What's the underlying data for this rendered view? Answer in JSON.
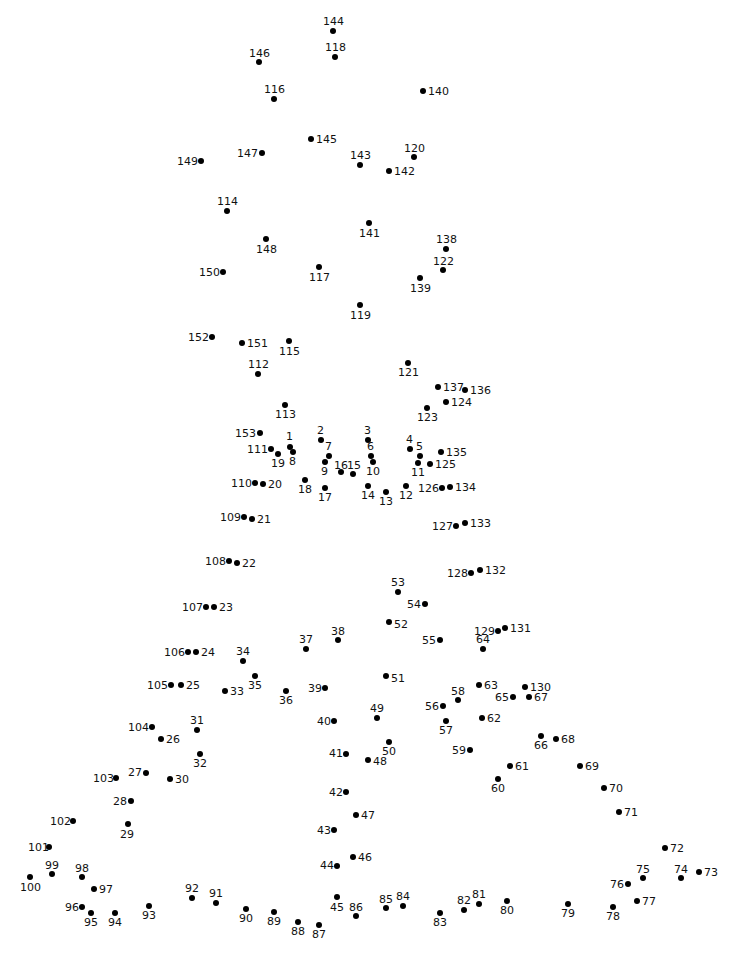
{
  "dot_color": "#000000",
  "label_color": "#111111",
  "background": "#ffffff",
  "dots": [
    {
      "n": "1",
      "x": 290,
      "y": 447,
      "lx": 286,
      "ly": 431
    },
    {
      "n": "2",
      "x": 321,
      "y": 440,
      "lx": 317,
      "ly": 425
    },
    {
      "n": "3",
      "x": 368,
      "y": 440,
      "lx": 364,
      "ly": 425
    },
    {
      "n": "4",
      "x": 410,
      "y": 449,
      "lx": 406,
      "ly": 434
    },
    {
      "n": "5",
      "x": 420,
      "y": 456,
      "lx": 416,
      "ly": 441
    },
    {
      "n": "6",
      "x": 371,
      "y": 456,
      "lx": 367,
      "ly": 441
    },
    {
      "n": "7",
      "x": 329,
      "y": 456,
      "lx": 325,
      "ly": 441
    },
    {
      "n": "8",
      "x": 293,
      "y": 452,
      "lx": 289,
      "ly": 456
    },
    {
      "n": "9",
      "x": 325,
      "y": 462,
      "lx": 321,
      "ly": 466
    },
    {
      "n": "10",
      "x": 373,
      "y": 462,
      "lx": 366,
      "ly": 466
    },
    {
      "n": "11",
      "x": 418,
      "y": 463,
      "lx": 411,
      "ly": 467
    },
    {
      "n": "12",
      "x": 406,
      "y": 486,
      "lx": 399,
      "ly": 490
    },
    {
      "n": "13",
      "x": 386,
      "y": 492,
      "lx": 379,
      "ly": 496
    },
    {
      "n": "14",
      "x": 368,
      "y": 486,
      "lx": 361,
      "ly": 490
    },
    {
      "n": "15",
      "x": 353,
      "y": 474,
      "lx": 347,
      "ly": 460
    },
    {
      "n": "16",
      "x": 341,
      "y": 472,
      "lx": 334,
      "ly": 460
    },
    {
      "n": "17",
      "x": 325,
      "y": 488,
      "lx": 318,
      "ly": 492
    },
    {
      "n": "18",
      "x": 305,
      "y": 480,
      "lx": 298,
      "ly": 484
    },
    {
      "n": "19",
      "x": 278,
      "y": 454,
      "lx": 271,
      "ly": 458
    },
    {
      "n": "20",
      "x": 263,
      "y": 484,
      "lx": 268,
      "ly": 479
    },
    {
      "n": "21",
      "x": 252,
      "y": 519,
      "lx": 257,
      "ly": 514
    },
    {
      "n": "22",
      "x": 237,
      "y": 563,
      "lx": 242,
      "ly": 558
    },
    {
      "n": "23",
      "x": 214,
      "y": 607,
      "lx": 219,
      "ly": 602
    },
    {
      "n": "24",
      "x": 196,
      "y": 652,
      "lx": 201,
      "ly": 647
    },
    {
      "n": "25",
      "x": 181,
      "y": 685,
      "lx": 186,
      "ly": 680
    },
    {
      "n": "26",
      "x": 161,
      "y": 739,
      "lx": 166,
      "ly": 734
    },
    {
      "n": "27",
      "x": 146,
      "y": 773,
      "lx": 128,
      "ly": 767
    },
    {
      "n": "28",
      "x": 131,
      "y": 801,
      "lx": 113,
      "ly": 796
    },
    {
      "n": "29",
      "x": 128,
      "y": 824,
      "lx": 120,
      "ly": 829
    },
    {
      "n": "30",
      "x": 170,
      "y": 779,
      "lx": 175,
      "ly": 774
    },
    {
      "n": "31",
      "x": 197,
      "y": 730,
      "lx": 190,
      "ly": 715
    },
    {
      "n": "32",
      "x": 200,
      "y": 754,
      "lx": 193,
      "ly": 758
    },
    {
      "n": "33",
      "x": 225,
      "y": 691,
      "lx": 230,
      "ly": 686
    },
    {
      "n": "34",
      "x": 243,
      "y": 661,
      "lx": 236,
      "ly": 646
    },
    {
      "n": "35",
      "x": 255,
      "y": 676,
      "lx": 248,
      "ly": 680
    },
    {
      "n": "36",
      "x": 286,
      "y": 691,
      "lx": 279,
      "ly": 695
    },
    {
      "n": "37",
      "x": 306,
      "y": 649,
      "lx": 299,
      "ly": 634
    },
    {
      "n": "38",
      "x": 338,
      "y": 640,
      "lx": 331,
      "ly": 626
    },
    {
      "n": "39",
      "x": 325,
      "y": 688,
      "lx": 308,
      "ly": 683
    },
    {
      "n": "40",
      "x": 334,
      "y": 721,
      "lx": 317,
      "ly": 716
    },
    {
      "n": "41",
      "x": 346,
      "y": 754,
      "lx": 329,
      "ly": 748
    },
    {
      "n": "42",
      "x": 346,
      "y": 792,
      "lx": 329,
      "ly": 787
    },
    {
      "n": "43",
      "x": 334,
      "y": 830,
      "lx": 317,
      "ly": 825
    },
    {
      "n": "44",
      "x": 337,
      "y": 866,
      "lx": 320,
      "ly": 860
    },
    {
      "n": "45",
      "x": 337,
      "y": 897,
      "lx": 330,
      "ly": 902
    },
    {
      "n": "46",
      "x": 353,
      "y": 857,
      "lx": 358,
      "ly": 852
    },
    {
      "n": "47",
      "x": 356,
      "y": 815,
      "lx": 361,
      "ly": 810
    },
    {
      "n": "48",
      "x": 368,
      "y": 760,
      "lx": 373,
      "ly": 756
    },
    {
      "n": "49",
      "x": 377,
      "y": 718,
      "lx": 370,
      "ly": 703
    },
    {
      "n": "50",
      "x": 389,
      "y": 742,
      "lx": 382,
      "ly": 746
    },
    {
      "n": "51",
      "x": 386,
      "y": 676,
      "lx": 391,
      "ly": 673
    },
    {
      "n": "52",
      "x": 389,
      "y": 622,
      "lx": 394,
      "ly": 619
    },
    {
      "n": "53",
      "x": 398,
      "y": 592,
      "lx": 391,
      "ly": 577
    },
    {
      "n": "54",
      "x": 425,
      "y": 604,
      "lx": 407,
      "ly": 599
    },
    {
      "n": "55",
      "x": 440,
      "y": 640,
      "lx": 422,
      "ly": 635
    },
    {
      "n": "56",
      "x": 443,
      "y": 706,
      "lx": 425,
      "ly": 701
    },
    {
      "n": "57",
      "x": 446,
      "y": 721,
      "lx": 439,
      "ly": 725
    },
    {
      "n": "58",
      "x": 458,
      "y": 700,
      "lx": 451,
      "ly": 686
    },
    {
      "n": "59",
      "x": 470,
      "y": 750,
      "lx": 452,
      "ly": 745
    },
    {
      "n": "60",
      "x": 498,
      "y": 779,
      "lx": 491,
      "ly": 783
    },
    {
      "n": "61",
      "x": 510,
      "y": 766,
      "lx": 515,
      "ly": 761
    },
    {
      "n": "62",
      "x": 482,
      "y": 718,
      "lx": 487,
      "ly": 713
    },
    {
      "n": "63",
      "x": 479,
      "y": 685,
      "lx": 484,
      "ly": 680
    },
    {
      "n": "64",
      "x": 483,
      "y": 649,
      "lx": 476,
      "ly": 634
    },
    {
      "n": "65",
      "x": 513,
      "y": 697,
      "lx": 495,
      "ly": 692
    },
    {
      "n": "66",
      "x": 541,
      "y": 736,
      "lx": 534,
      "ly": 740
    },
    {
      "n": "67",
      "x": 529,
      "y": 697,
      "lx": 534,
      "ly": 692
    },
    {
      "n": "68",
      "x": 556,
      "y": 739,
      "lx": 561,
      "ly": 734
    },
    {
      "n": "69",
      "x": 580,
      "y": 766,
      "lx": 585,
      "ly": 761
    },
    {
      "n": "70",
      "x": 604,
      "y": 788,
      "lx": 609,
      "ly": 783
    },
    {
      "n": "71",
      "x": 619,
      "y": 812,
      "lx": 624,
      "ly": 807
    },
    {
      "n": "72",
      "x": 665,
      "y": 848,
      "lx": 670,
      "ly": 843
    },
    {
      "n": "73",
      "x": 699,
      "y": 872,
      "lx": 704,
      "ly": 867
    },
    {
      "n": "74",
      "x": 681,
      "y": 878,
      "lx": 674,
      "ly": 864
    },
    {
      "n": "75",
      "x": 643,
      "y": 878,
      "lx": 636,
      "ly": 864
    },
    {
      "n": "76",
      "x": 628,
      "y": 884,
      "lx": 610,
      "ly": 879
    },
    {
      "n": "77",
      "x": 637,
      "y": 901,
      "lx": 642,
      "ly": 896
    },
    {
      "n": "78",
      "x": 613,
      "y": 907,
      "lx": 606,
      "ly": 911
    },
    {
      "n": "79",
      "x": 568,
      "y": 904,
      "lx": 561,
      "ly": 908
    },
    {
      "n": "80",
      "x": 507,
      "y": 901,
      "lx": 500,
      "ly": 905
    },
    {
      "n": "81",
      "x": 479,
      "y": 904,
      "lx": 472,
      "ly": 889
    },
    {
      "n": "82",
      "x": 464,
      "y": 910,
      "lx": 457,
      "ly": 895
    },
    {
      "n": "83",
      "x": 440,
      "y": 913,
      "lx": 433,
      "ly": 917
    },
    {
      "n": "84",
      "x": 403,
      "y": 906,
      "lx": 396,
      "ly": 891
    },
    {
      "n": "85",
      "x": 386,
      "y": 908,
      "lx": 379,
      "ly": 894
    },
    {
      "n": "86",
      "x": 356,
      "y": 916,
      "lx": 349,
      "ly": 902
    },
    {
      "n": "87",
      "x": 319,
      "y": 925,
      "lx": 312,
      "ly": 929
    },
    {
      "n": "88",
      "x": 298,
      "y": 922,
      "lx": 291,
      "ly": 926
    },
    {
      "n": "89",
      "x": 274,
      "y": 912,
      "lx": 267,
      "ly": 916
    },
    {
      "n": "90",
      "x": 246,
      "y": 909,
      "lx": 239,
      "ly": 913
    },
    {
      "n": "91",
      "x": 216,
      "y": 903,
      "lx": 209,
      "ly": 888
    },
    {
      "n": "92",
      "x": 192,
      "y": 898,
      "lx": 185,
      "ly": 883
    },
    {
      "n": "93",
      "x": 149,
      "y": 906,
      "lx": 142,
      "ly": 910
    },
    {
      "n": "94",
      "x": 115,
      "y": 913,
      "lx": 108,
      "ly": 917
    },
    {
      "n": "95",
      "x": 91,
      "y": 913,
      "lx": 84,
      "ly": 917
    },
    {
      "n": "96",
      "x": 82,
      "y": 907,
      "lx": 65,
      "ly": 902
    },
    {
      "n": "97",
      "x": 94,
      "y": 889,
      "lx": 99,
      "ly": 884
    },
    {
      "n": "98",
      "x": 82,
      "y": 877,
      "lx": 75,
      "ly": 863
    },
    {
      "n": "99",
      "x": 52,
      "y": 874,
      "lx": 45,
      "ly": 860
    },
    {
      "n": "100",
      "x": 30,
      "y": 877,
      "lx": 20,
      "ly": 882
    },
    {
      "n": "101",
      "x": 49,
      "y": 847,
      "lx": 28,
      "ly": 842
    },
    {
      "n": "102",
      "x": 73,
      "y": 821,
      "lx": 50,
      "ly": 816
    },
    {
      "n": "103",
      "x": 116,
      "y": 778,
      "lx": 93,
      "ly": 773
    },
    {
      "n": "104",
      "x": 152,
      "y": 727,
      "lx": 128,
      "ly": 722
    },
    {
      "n": "105",
      "x": 171,
      "y": 685,
      "lx": 147,
      "ly": 680
    },
    {
      "n": "106",
      "x": 188,
      "y": 652,
      "lx": 164,
      "ly": 647
    },
    {
      "n": "107",
      "x": 206,
      "y": 607,
      "lx": 182,
      "ly": 602
    },
    {
      "n": "108",
      "x": 229,
      "y": 561,
      "lx": 205,
      "ly": 556
    },
    {
      "n": "109",
      "x": 244,
      "y": 517,
      "lx": 220,
      "ly": 512
    },
    {
      "n": "110",
      "x": 255,
      "y": 483,
      "lx": 231,
      "ly": 478
    },
    {
      "n": "111",
      "x": 271,
      "y": 449,
      "lx": 247,
      "ly": 444
    },
    {
      "n": "112",
      "x": 258,
      "y": 374,
      "lx": 248,
      "ly": 359
    },
    {
      "n": "113",
      "x": 285,
      "y": 405,
      "lx": 275,
      "ly": 409
    },
    {
      "n": "114",
      "x": 227,
      "y": 211,
      "lx": 217,
      "ly": 196
    },
    {
      "n": "115",
      "x": 289,
      "y": 341,
      "lx": 279,
      "ly": 346
    },
    {
      "n": "116",
      "x": 274,
      "y": 99,
      "lx": 264,
      "ly": 84
    },
    {
      "n": "117",
      "x": 319,
      "y": 267,
      "lx": 309,
      "ly": 272
    },
    {
      "n": "118",
      "x": 335,
      "y": 57,
      "lx": 325,
      "ly": 42
    },
    {
      "n": "119",
      "x": 360,
      "y": 305,
      "lx": 350,
      "ly": 310
    },
    {
      "n": "120",
      "x": 414,
      "y": 157,
      "lx": 404,
      "ly": 143
    },
    {
      "n": "121",
      "x": 408,
      "y": 363,
      "lx": 398,
      "ly": 367
    },
    {
      "n": "122",
      "x": 443,
      "y": 270,
      "lx": 433,
      "ly": 256
    },
    {
      "n": "123",
      "x": 427,
      "y": 408,
      "lx": 417,
      "ly": 412
    },
    {
      "n": "124",
      "x": 446,
      "y": 402,
      "lx": 451,
      "ly": 397
    },
    {
      "n": "125",
      "x": 430,
      "y": 464,
      "lx": 435,
      "ly": 459
    },
    {
      "n": "126",
      "x": 442,
      "y": 488,
      "lx": 418,
      "ly": 483
    },
    {
      "n": "127",
      "x": 456,
      "y": 526,
      "lx": 432,
      "ly": 521
    },
    {
      "n": "128",
      "x": 471,
      "y": 573,
      "lx": 447,
      "ly": 568
    },
    {
      "n": "129",
      "x": 498,
      "y": 631,
      "lx": 474,
      "ly": 626
    },
    {
      "n": "130",
      "x": 525,
      "y": 687,
      "lx": 530,
      "ly": 682
    },
    {
      "n": "131",
      "x": 505,
      "y": 628,
      "lx": 510,
      "ly": 623
    },
    {
      "n": "132",
      "x": 480,
      "y": 570,
      "lx": 485,
      "ly": 565
    },
    {
      "n": "133",
      "x": 465,
      "y": 523,
      "lx": 470,
      "ly": 518
    },
    {
      "n": "134",
      "x": 450,
      "y": 487,
      "lx": 455,
      "ly": 482
    },
    {
      "n": "135",
      "x": 441,
      "y": 452,
      "lx": 446,
      "ly": 447
    },
    {
      "n": "136",
      "x": 465,
      "y": 390,
      "lx": 470,
      "ly": 385
    },
    {
      "n": "137",
      "x": 438,
      "y": 387,
      "lx": 443,
      "ly": 382
    },
    {
      "n": "138",
      "x": 446,
      "y": 249,
      "lx": 436,
      "ly": 234
    },
    {
      "n": "139",
      "x": 420,
      "y": 278,
      "lx": 410,
      "ly": 283
    },
    {
      "n": "140",
      "x": 423,
      "y": 91,
      "lx": 428,
      "ly": 86
    },
    {
      "n": "141",
      "x": 369,
      "y": 223,
      "lx": 359,
      "ly": 228
    },
    {
      "n": "142",
      "x": 389,
      "y": 171,
      "lx": 394,
      "ly": 166
    },
    {
      "n": "143",
      "x": 360,
      "y": 165,
      "lx": 350,
      "ly": 150
    },
    {
      "n": "144",
      "x": 333,
      "y": 31,
      "lx": 323,
      "ly": 16
    },
    {
      "n": "145",
      "x": 311,
      "y": 139,
      "lx": 316,
      "ly": 134
    },
    {
      "n": "146",
      "x": 259,
      "y": 62,
      "lx": 249,
      "ly": 48
    },
    {
      "n": "147",
      "x": 262,
      "y": 153,
      "lx": 237,
      "ly": 148
    },
    {
      "n": "148",
      "x": 266,
      "y": 239,
      "lx": 256,
      "ly": 244
    },
    {
      "n": "149",
      "x": 201,
      "y": 161,
      "lx": 177,
      "ly": 156
    },
    {
      "n": "150",
      "x": 223,
      "y": 272,
      "lx": 199,
      "ly": 267
    },
    {
      "n": "151",
      "x": 242,
      "y": 343,
      "lx": 247,
      "ly": 338
    },
    {
      "n": "152",
      "x": 212,
      "y": 337,
      "lx": 188,
      "ly": 332
    },
    {
      "n": "153",
      "x": 260,
      "y": 433,
      "lx": 235,
      "ly": 428
    }
  ]
}
